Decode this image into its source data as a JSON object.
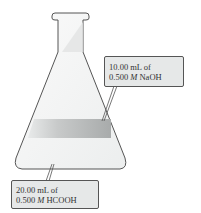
{
  "diagram": {
    "type": "erlenmeyer-flask-titration",
    "labels": {
      "naoh": {
        "line1": "10.00 mL of",
        "line2_prefix": "0.500 ",
        "line2_unit": "M",
        "line2_suffix": " NaOH"
      },
      "hcooh": {
        "line1": "20.00 mL of",
        "line2_prefix": "0.500 ",
        "line2_unit": "M",
        "line2_suffix": " HCOOH"
      }
    },
    "colors": {
      "flask_outline": "#555555",
      "flask_fill": "#f4f5f5",
      "naoh_band": "#b9bcbc",
      "label_bg": "#e6e8e8"
    }
  }
}
